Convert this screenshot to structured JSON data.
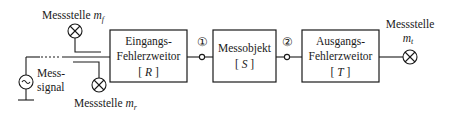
{
  "diagram": {
    "type": "block-diagram",
    "measurement_points": {
      "forward": {
        "label": "Messstelle",
        "symbol": "m",
        "subscript": "f"
      },
      "reflected": {
        "label": "Messstelle",
        "symbol": "m",
        "subscript": "r"
      },
      "transmitted": {
        "label": "Messstelle",
        "symbol": "m",
        "subscript": "t"
      }
    },
    "source": {
      "label_line1": "Mess-",
      "label_line2": "signal",
      "icon": "ac-source-icon"
    },
    "blocks": [
      {
        "id": "R",
        "line1": "Eingangs-",
        "line2": "Fehlerzweitor",
        "matrix": "[ R ]",
        "matrix_letter": "R"
      },
      {
        "id": "S",
        "line1": "Messobjekt",
        "matrix": "[ S ]",
        "matrix_letter": "S"
      },
      {
        "id": "T",
        "line1": "Ausgangs-",
        "line2": "Fehlerzweitor",
        "matrix": "[ T ]",
        "matrix_letter": "T"
      }
    ],
    "ports": [
      {
        "label": "①"
      },
      {
        "label": "②"
      }
    ],
    "colors": {
      "line": "#1a1a1a",
      "background": "#ffffff"
    }
  }
}
